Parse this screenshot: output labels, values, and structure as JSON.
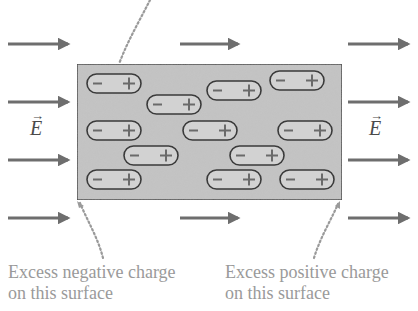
{
  "diagram": {
    "field_label": "E",
    "field_vector_symbol": "→",
    "captions": {
      "negative": [
        "Excess negative charge",
        "on this surface"
      ],
      "positive": [
        "Excess positive charge",
        "on this surface"
      ]
    },
    "dipole_signs": {
      "minus": "−",
      "plus": "+"
    },
    "colors": {
      "arrow": "#6e6e6e",
      "box_fill": "#c4c4c4",
      "box_stroke": "#3a3a3a",
      "dipole_stroke": "#3a3a3a",
      "caption": "#9a9a9a",
      "pointer": "#9a9a9a"
    },
    "box": {
      "x": 77,
      "y": 64,
      "width": 265,
      "height": 136
    },
    "field_arrows": [
      {
        "x1": 8,
        "x2": 70,
        "y": 44
      },
      {
        "x1": 8,
        "x2": 70,
        "y": 102
      },
      {
        "x1": 8,
        "x2": 70,
        "y": 160
      },
      {
        "x1": 8,
        "x2": 70,
        "y": 218
      },
      {
        "x1": 180,
        "x2": 240,
        "y": 44
      },
      {
        "x1": 180,
        "x2": 240,
        "y": 218
      },
      {
        "x1": 348,
        "x2": 410,
        "y": 44
      },
      {
        "x1": 348,
        "x2": 410,
        "y": 102
      },
      {
        "x1": 348,
        "x2": 410,
        "y": 160
      },
      {
        "x1": 348,
        "x2": 410,
        "y": 218
      }
    ],
    "dipoles": [
      {
        "x": 87,
        "y": 74
      },
      {
        "x": 147,
        "y": 95
      },
      {
        "x": 207,
        "y": 81
      },
      {
        "x": 270,
        "y": 71
      },
      {
        "x": 87,
        "y": 121
      },
      {
        "x": 183,
        "y": 121
      },
      {
        "x": 278,
        "y": 121
      },
      {
        "x": 124,
        "y": 146
      },
      {
        "x": 230,
        "y": 146
      },
      {
        "x": 87,
        "y": 170
      },
      {
        "x": 207,
        "y": 170
      },
      {
        "x": 280,
        "y": 170
      }
    ]
  }
}
